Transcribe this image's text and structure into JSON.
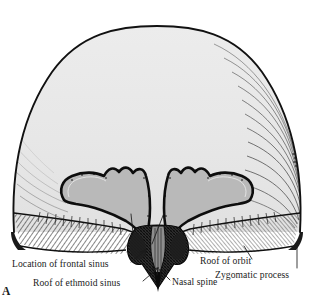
{
  "figure": {
    "letter": "A",
    "view": "anterior view of the interior of the skull",
    "colors": {
      "background": "#ffffff",
      "vault_fill": "#e8e8e8",
      "orbital_roof_fill": "#b9b9b9",
      "outline": "#111111",
      "hatching": "#2a2a2a",
      "label_text": "#1b1b1b"
    }
  },
  "labels": {
    "location_of_frontal_sinus": "Location of frontal sinus",
    "roof_of_ethmoid_sinus": "Roof of ethmoid sinus",
    "nasal_spine": "Nasal spine",
    "roof_of_orbit": "Roof of orbit",
    "zygomatic_process": "Zygomatic process"
  },
  "structures": [
    {
      "name": "cranial-vault",
      "description": "dome-shaped calvaria with light gray fill"
    },
    {
      "name": "orbital-roof-left",
      "description": "wing-shaped roof of left orbit, scalloped superior margin"
    },
    {
      "name": "orbital-roof-right",
      "description": "wing-shaped roof of right orbit, scalloped superior margin"
    },
    {
      "name": "nasal-spine",
      "description": "dark cross-hatched midline nasal spine"
    },
    {
      "name": "ethmoid-region",
      "description": "roof of ethmoid sinus, cribriform area flanking nasal spine"
    },
    {
      "name": "zygomatic-process",
      "description": "tapered lateral process at inferolateral skull margin"
    },
    {
      "name": "skull-base-hatching",
      "description": "diagonal line hatching along inferior skull margin"
    }
  ]
}
